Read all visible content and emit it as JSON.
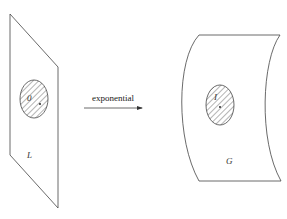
{
  "diagram": {
    "left_plane_label": "L",
    "left_point_label": "0",
    "arrow_label": "exponential",
    "right_surface_label": "G",
    "right_point_label": "I"
  }
}
